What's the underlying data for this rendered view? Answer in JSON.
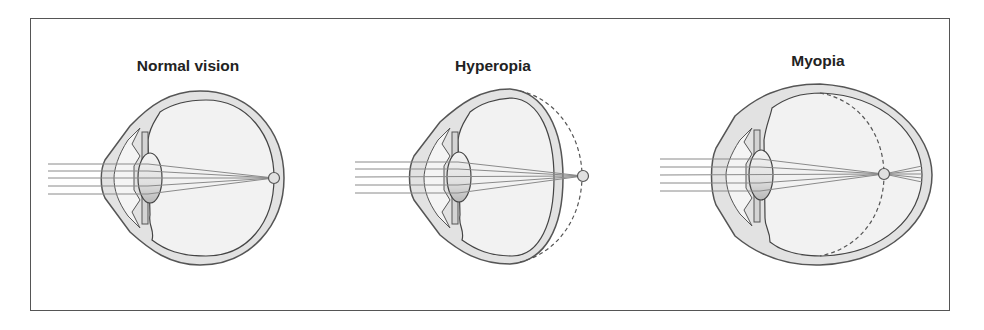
{
  "figure": {
    "panels": [
      {
        "id": "normal",
        "title": "Normal vision",
        "focus": "on retina"
      },
      {
        "id": "hyperopia",
        "title": "Hyperopia",
        "focus": "behind retina"
      },
      {
        "id": "myopia",
        "title": "Myopia",
        "focus": "in front of retina"
      }
    ]
  },
  "colors": {
    "outline": "#555555",
    "sclera_fill": "#e2e2e2",
    "vitreous_fill": "#f2f2f2",
    "ray": "#8a8a8a",
    "lens_fill": "#dcdcdc",
    "frame": "#555555"
  }
}
